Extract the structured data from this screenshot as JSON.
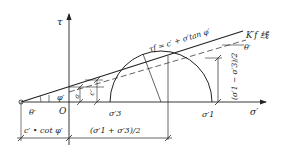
{
  "diagram": {
    "axes": {
      "tau_label": "τ",
      "sigma_label": "σ′",
      "origin_label": "O"
    },
    "envelope": {
      "equation": "τf = c′ + σ′tan φ′",
      "line_label": "K′f 线"
    },
    "angles": {
      "theta_left": "θ′",
      "theta_right": "θ′",
      "phi": "φ′"
    },
    "intercepts": {
      "a_label": "a",
      "c_label": "c′"
    },
    "circle_points": {
      "sigma3": "σ′3",
      "sigma1": "σ′1"
    },
    "dimensions": {
      "radius": "(σ′1 − σ′3)/2",
      "left": "c′ • cot φ′",
      "center": "(σ′1 + σ′3)/2"
    },
    "colors": {
      "line": "#222222",
      "background": "#ffffff"
    }
  }
}
